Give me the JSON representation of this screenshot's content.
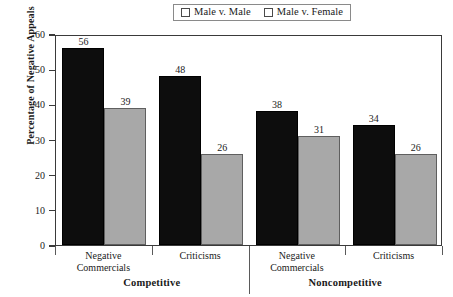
{
  "chart_data": {
    "type": "bar",
    "title": "",
    "xlabel": "",
    "ylabel": "Percentage of Negative Appeals",
    "ylim": [
      0,
      60
    ],
    "yticks": [
      0,
      10,
      20,
      30,
      40,
      50,
      60
    ],
    "grid": false,
    "legend_position": "top-center",
    "group_labels": [
      "Competitive",
      "Noncompetitive"
    ],
    "categories": [
      "Negative Commercials",
      "Criticisms",
      "Negative Commercials",
      "Criticisms"
    ],
    "category_lines": [
      [
        "Negative",
        "Commercials"
      ],
      [
        "Criticisms"
      ],
      [
        "Negative",
        "Commercials"
      ],
      [
        "Criticisms"
      ]
    ],
    "series": [
      {
        "name": "Male v. Male",
        "color": "#0d0d0d",
        "values": [
          56,
          48,
          38,
          34
        ]
      },
      {
        "name": "Male v. Female",
        "color": "#a8a8a8",
        "values": [
          39,
          26,
          31,
          26
        ]
      }
    ]
  },
  "legend": {
    "entries": [
      {
        "label": "Male v. Male",
        "swatch": "black-square"
      },
      {
        "label": "Male v. Female",
        "swatch": "grey-square"
      }
    ]
  }
}
